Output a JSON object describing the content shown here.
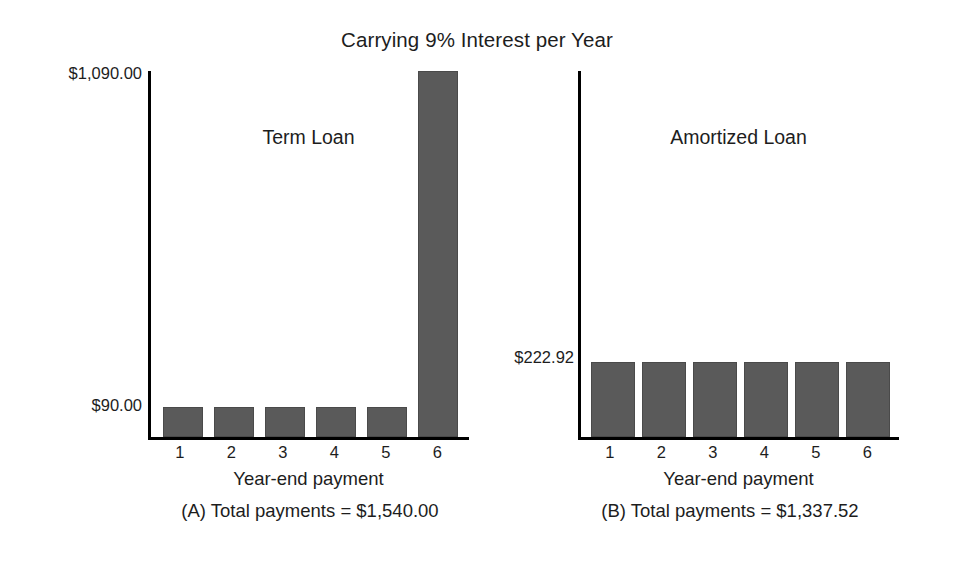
{
  "chart_data": {
    "type": "bar",
    "title": "Carrying 9% Interest per Year",
    "panels": [
      {
        "id": "A",
        "series_label": "Term Loan",
        "xlabel": "Year-end payment",
        "ylabel": "",
        "categories": [
          "1",
          "2",
          "3",
          "4",
          "5",
          "6"
        ],
        "values": [
          90.0,
          90.0,
          90.0,
          90.0,
          90.0,
          1090.0
        ],
        "ylim": [
          0,
          1090
        ],
        "ytick_values": [
          90,
          1090
        ],
        "ytick_labels": [
          "$90.00",
          "$1,090.00"
        ],
        "grid": false,
        "legend": "none",
        "caption": "(A) Total payments = $1,540.00",
        "total_payments": "$1,540.00"
      },
      {
        "id": "B",
        "series_label": "Amortized Loan",
        "xlabel": "Year-end payment",
        "ylabel": "",
        "categories": [
          "1",
          "2",
          "3",
          "4",
          "5",
          "6"
        ],
        "values": [
          222.92,
          222.92,
          222.92,
          222.92,
          222.92,
          222.92
        ],
        "ylim": [
          0,
          1090
        ],
        "ytick_values": [
          222.92
        ],
        "ytick_labels": [
          "$222.92"
        ],
        "grid": false,
        "legend": "none",
        "caption": "(B) Total payments = $1,337.52",
        "total_payments": "$1,337.52"
      }
    ],
    "colors": {
      "bar_fill": "#5a5a5a",
      "axis": "#000000",
      "text": "#1d1d1d",
      "background": "#ffffff"
    }
  }
}
